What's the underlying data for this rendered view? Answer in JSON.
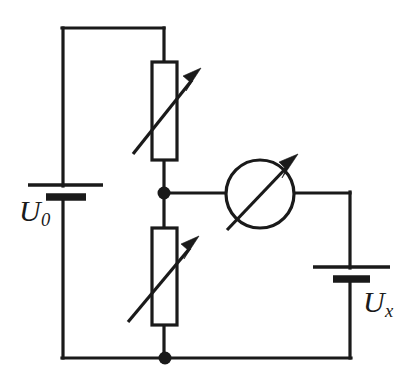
{
  "figure": {
    "kind": "electrical-circuit-schematic",
    "background_color": "#ffffff",
    "line_color": "#1a1a1a",
    "width": 414,
    "height": 384
  },
  "labels": {
    "source_voltage": "U",
    "source_voltage_subscript": "0",
    "unknown_voltage": "U",
    "unknown_voltage_subscript": "x"
  },
  "components": [
    {
      "id": "battery-u0",
      "name": "source-battery",
      "symbol": "battery-cell",
      "label": "U0",
      "position": "left",
      "plates": [
        {
          "type": "thin-long",
          "x1": 28,
          "x2": 103,
          "y": 185
        },
        {
          "type": "thick-short",
          "x1": 46,
          "x2": 86,
          "y": 197
        }
      ]
    },
    {
      "id": "rheostat-upper",
      "name": "upper-variable-resistor",
      "symbol": "variable-resistor",
      "box": {
        "x": 152,
        "y": 62,
        "width": 25,
        "height": 98
      },
      "arrow": {
        "x1": 133,
        "y1": 154,
        "x2": 200,
        "y2": 70
      }
    },
    {
      "id": "rheostat-lower",
      "name": "lower-variable-resistor",
      "symbol": "variable-resistor",
      "box": {
        "x": 152,
        "y": 228,
        "width": 25,
        "height": 97
      },
      "arrow": {
        "x1": 128,
        "y1": 322,
        "x2": 198,
        "y2": 238
      }
    },
    {
      "id": "meter",
      "name": "adjustable-meter",
      "symbol": "circle-with-diagonal-arrow",
      "circle": {
        "cx": 260,
        "cy": 194,
        "r": 34
      },
      "arrow": {
        "x1": 226,
        "y1": 230,
        "x2": 297,
        "y2": 157
      }
    },
    {
      "id": "battery-ux",
      "name": "unknown-voltage-battery",
      "symbol": "battery-cell",
      "label": "Ux",
      "position": "right",
      "plates": [
        {
          "type": "thin-long",
          "x1": 313,
          "x2": 390,
          "y": 267
        },
        {
          "type": "thick-short",
          "x1": 333,
          "x2": 370,
          "y": 279
        }
      ]
    }
  ],
  "nodes": [
    {
      "id": "node-mid",
      "name": "center-tap-junction",
      "cx": 164,
      "cy": 193,
      "r": 6.5
    },
    {
      "id": "node-bottom",
      "name": "bottom-rail-junction",
      "cx": 165,
      "cy": 358,
      "r": 6.5
    }
  ],
  "wires": [
    {
      "id": "wire-left-rail-top",
      "points": "63,185 63,28"
    },
    {
      "id": "wire-top",
      "points": "63,28 164,28"
    },
    {
      "id": "wire-top-to-upper-resistor",
      "points": "164,28 164,62"
    },
    {
      "id": "wire-upper-resistor-to-node",
      "points": "164,160 164,193"
    },
    {
      "id": "wire-node-to-lower-resistor",
      "points": "164,193 164,228"
    },
    {
      "id": "wire-lower-resistor-to-bottom",
      "points": "164,325 164,358"
    },
    {
      "id": "wire-node-to-meter",
      "points": "164,193 226,193"
    },
    {
      "id": "wire-meter-to-right-rail",
      "points": "294,193 350,193"
    },
    {
      "id": "wire-right-rail-upper",
      "points": "350,193 350,267"
    },
    {
      "id": "wire-right-rail-lower",
      "points": "350,279 350,358"
    },
    {
      "id": "wire-bottom-left",
      "points": "63,358 165,358"
    },
    {
      "id": "wire-bottom-right",
      "points": "165,358 350,358"
    },
    {
      "id": "wire-left-rail-bottom",
      "points": "63,197 63,358"
    }
  ]
}
